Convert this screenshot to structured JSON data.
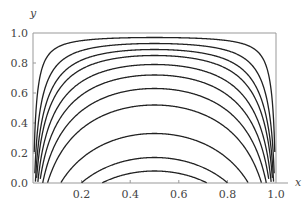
{
  "chart_data": {
    "type": "line",
    "title": "",
    "xlabel": "x",
    "ylabel": "y",
    "xlim": [
      0,
      1.0
    ],
    "ylim": [
      0,
      1.0
    ],
    "grid": false,
    "legend": null,
    "x_ticks": [
      "0.2",
      "0.4",
      "0.6",
      "0.8",
      "1.0"
    ],
    "y_ticks": [
      "0.0",
      "0.2",
      "0.4",
      "0.6",
      "0.8",
      "1.0"
    ],
    "series": [
      {
        "name": "level-1",
        "min_y_at_x_0_5": 0.08
      },
      {
        "name": "level-2",
        "min_y_at_x_0_5": 0.17
      },
      {
        "name": "level-3",
        "min_y_at_x_0_5": 0.33
      },
      {
        "name": "level-4",
        "min_y_at_x_0_5": 0.52
      },
      {
        "name": "level-5",
        "min_y_at_x_0_5": 0.63
      },
      {
        "name": "level-6",
        "min_y_at_x_0_5": 0.72
      },
      {
        "name": "level-7",
        "min_y_at_x_0_5": 0.79
      },
      {
        "name": "level-8",
        "min_y_at_x_0_5": 0.85
      },
      {
        "name": "level-9",
        "min_y_at_x_0_5": 0.89
      },
      {
        "name": "level-10",
        "min_y_at_x_0_5": 0.93
      },
      {
        "name": "level-11",
        "min_y_at_x_0_5": 0.97
      }
    ]
  }
}
